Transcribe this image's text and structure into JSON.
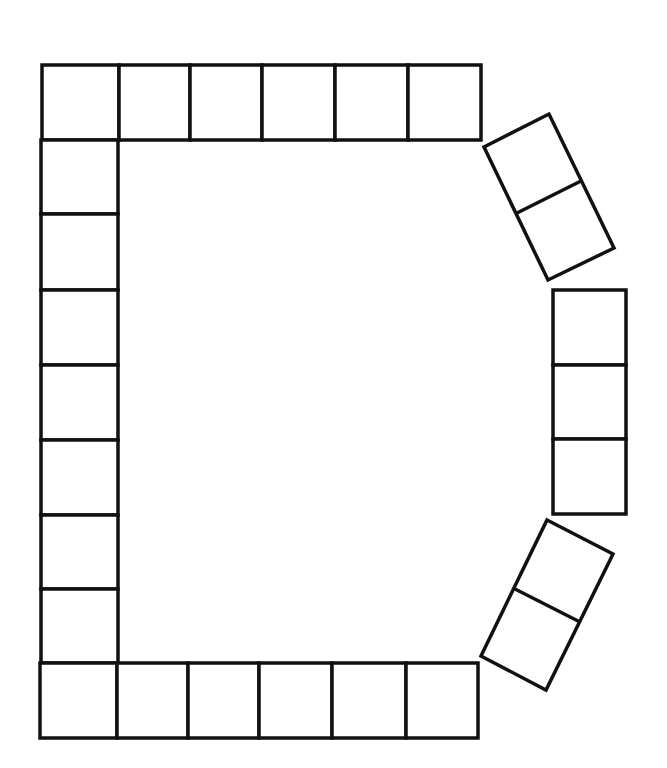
{
  "diagram": {
    "title": "",
    "colors": {
      "background": "#ffffff",
      "stroke": "#111111"
    },
    "top_row": {
      "y": 65,
      "h": 75,
      "xs": [
        42,
        119,
        190,
        262,
        335,
        408,
        481
      ]
    },
    "left_column": {
      "x": 41,
      "w": 77,
      "ys": [
        140,
        214,
        290,
        365,
        440,
        515,
        589,
        663
      ]
    },
    "bottom_row": {
      "y": 663,
      "h": 75,
      "xs": [
        40,
        117,
        188,
        259,
        332,
        406,
        478
      ]
    },
    "right_column": {
      "x": 553,
      "w": 73,
      "ys": [
        290,
        365,
        439,
        514
      ]
    },
    "upper_angled_pair": {
      "corners": [
        [
          484,
          147
        ],
        [
          549,
          114
        ],
        [
          614,
          248
        ],
        [
          548,
          280
        ]
      ],
      "divider": [
        [
          517,
          213
        ],
        [
          581,
          181
        ]
      ]
    },
    "lower_angled_pair": {
      "corners": [
        [
          547,
          520
        ],
        [
          613,
          554
        ],
        [
          546,
          690
        ],
        [
          481,
          656
        ]
      ],
      "divider": [
        [
          515,
          589
        ],
        [
          580,
          622
        ]
      ]
    }
  }
}
